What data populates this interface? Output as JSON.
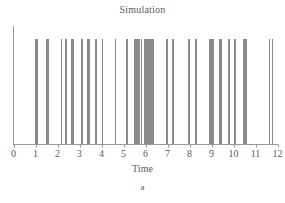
{
  "chart_data": {
    "type": "line",
    "title": "Simulation",
    "subtitle": "",
    "xlabel": "Time",
    "ylabel": "",
    "panel_label": "a",
    "grid": false,
    "legend": null,
    "xlim": [
      0,
      12
    ],
    "ylim": [
      0,
      1
    ],
    "xticks": [
      0,
      1,
      2,
      3,
      4,
      5,
      6,
      7,
      8,
      9,
      10,
      11,
      12
    ],
    "xtick_labels": [
      "0",
      "1",
      "2",
      "3",
      "4",
      "5",
      "6",
      "7",
      "8",
      "9",
      "10",
      "11",
      "12"
    ],
    "yticks": [],
    "ytick_labels": [],
    "series": [
      {
        "name": "events",
        "kind": "event-spikes",
        "spike_height": 1.0,
        "x": [
          0.98,
          1.02,
          1.06,
          1.46,
          1.5,
          1.56,
          2.14,
          2.17,
          2.36,
          2.4,
          2.62,
          2.66,
          2.7,
          3.06,
          3.1,
          3.34,
          3.38,
          3.42,
          3.72,
          3.76,
          4.02,
          4.62,
          5.1,
          5.14,
          5.46,
          5.52,
          5.56,
          5.6,
          5.64,
          5.68,
          5.72,
          5.78,
          5.94,
          5.98,
          6.02,
          6.06,
          6.1,
          6.14,
          6.18,
          6.22,
          6.26,
          6.3,
          6.36,
          6.94,
          6.98,
          7.22,
          7.26,
          7.94,
          7.98,
          8.24,
          8.28,
          8.9,
          8.94,
          8.98,
          9.02,
          9.08,
          9.34,
          9.38,
          9.44,
          9.76,
          9.8,
          10.02,
          10.06,
          10.42,
          10.46,
          10.5,
          10.54,
          10.58,
          11.62,
          11.74
        ]
      }
    ],
    "axis_style": {
      "spine_left": true,
      "spine_bottom": true,
      "spine_top": false,
      "spine_right": false,
      "line_color": "#999999",
      "spike_color": "#8a8a8a"
    },
    "colors": {
      "background": "#ffffff",
      "text": "#5a5a5a",
      "axis": "#999999",
      "spike": "#8a8a8a"
    }
  }
}
